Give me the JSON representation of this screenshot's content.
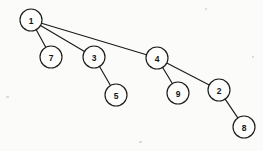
{
  "diagram": {
    "type": "tree",
    "background_color": "#fbfbf9",
    "stroke_color": "#1b1b1b",
    "node_fill_color": "#fdfdfb",
    "node_radius": 11,
    "canvas": {
      "width": 263,
      "height": 151
    },
    "nodes": [
      {
        "id": "n1",
        "label": "1",
        "x": 31,
        "y": 20
      },
      {
        "id": "n7",
        "label": "7",
        "x": 51,
        "y": 57
      },
      {
        "id": "n3",
        "label": "3",
        "x": 94,
        "y": 57
      },
      {
        "id": "n4",
        "label": "4",
        "x": 157,
        "y": 58
      },
      {
        "id": "n5",
        "label": "5",
        "x": 116,
        "y": 95
      },
      {
        "id": "n9",
        "label": "9",
        "x": 178,
        "y": 93
      },
      {
        "id": "n2",
        "label": "2",
        "x": 219,
        "y": 90
      },
      {
        "id": "n8",
        "label": "8",
        "x": 244,
        "y": 127
      }
    ],
    "edges": [
      {
        "id": "e1-7",
        "from": "n1",
        "to": "n7"
      },
      {
        "id": "e1-3",
        "from": "n1",
        "to": "n3"
      },
      {
        "id": "e1-4",
        "from": "n1",
        "to": "n4"
      },
      {
        "id": "e3-5",
        "from": "n3",
        "to": "n5"
      },
      {
        "id": "e4-9",
        "from": "n4",
        "to": "n9"
      },
      {
        "id": "e4-2",
        "from": "n4",
        "to": "n2"
      },
      {
        "id": "e2-8",
        "from": "n2",
        "to": "n8"
      }
    ]
  }
}
